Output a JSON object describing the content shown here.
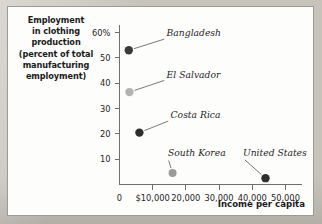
{
  "figure": {
    "y_axis_caption_lines": [
      "Employment",
      "in clothing",
      "production",
      "(percent of total",
      "manufacturing",
      "employment)"
    ],
    "x_axis_caption": "Income per capita"
  },
  "chart_data": {
    "type": "scatter",
    "title": "",
    "xlabel": "Income per capita",
    "ylabel": "Employment in clothing production (percent of total manufacturing employment)",
    "xlim": [
      0,
      55000
    ],
    "ylim": [
      0,
      63
    ],
    "grid": false,
    "legend": "none",
    "x_ticks": [
      {
        "value": 0,
        "label": "0"
      },
      {
        "value": 10000,
        "label": "$10,000"
      },
      {
        "value": 20000,
        "label": "20,000"
      },
      {
        "value": 30000,
        "label": "30,000"
      },
      {
        "value": 40000,
        "label": "40,000"
      },
      {
        "value": 50000,
        "label": "50,000"
      }
    ],
    "y_ticks": [
      {
        "value": 10,
        "label": "10"
      },
      {
        "value": 20,
        "label": "20"
      },
      {
        "value": 30,
        "label": "30"
      },
      {
        "value": 40,
        "label": "40"
      },
      {
        "value": 50,
        "label": "50"
      },
      {
        "value": 60,
        "label": "60%"
      }
    ],
    "points": [
      {
        "label": "Bangladesh",
        "x": 2800,
        "y": 53,
        "color": "#3a3a3a",
        "radius": 4.2,
        "label_x": 14200,
        "label_y": 58.5,
        "label_anchor": "start"
      },
      {
        "label": "El Salvador",
        "x": 3000,
        "y": 36.5,
        "color": "#b3b3b3",
        "radius": 4.2,
        "label_x": 14200,
        "label_y": 42.2,
        "label_anchor": "start"
      },
      {
        "label": "Costa Rica",
        "x": 6000,
        "y": 20.5,
        "color": "#2e2e2e",
        "radius": 4.2,
        "label_x": 15400,
        "label_y": 26.2,
        "label_anchor": "start"
      },
      {
        "label": "South Korea",
        "x": 16000,
        "y": 4.5,
        "color": "#9a9a9a",
        "radius": 4.0,
        "label_x": 14600,
        "label_y": 11.2,
        "label_anchor": "start"
      },
      {
        "label": "United States",
        "x": 44000,
        "y": 2.5,
        "color": "#2e2e2e",
        "radius": 4.2,
        "label_x": 37200,
        "label_y": 11.2,
        "label_anchor": "start"
      }
    ]
  }
}
